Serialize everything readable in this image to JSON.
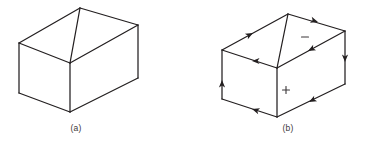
{
  "figure": {
    "title": "",
    "background_color": "#ffffff",
    "line_color": "#231f20",
    "panels": [
      {
        "id": "a",
        "label": "(a)",
        "label_x": 76,
        "label_y": 131,
        "description": "open rectangular box drawn in wireframe, no orientation arrows",
        "vertices": {
          "back_left": [
            19,
            43
          ],
          "back_top": [
            80,
            8
          ],
          "right_top": [
            138,
            25
          ],
          "front_top": [
            70,
            63
          ],
          "front_bottom": [
            70,
            112
          ],
          "left_bottom": [
            19,
            93
          ],
          "right_bottom": [
            138,
            78
          ]
        },
        "edges": [
          [
            [
              19,
              43
            ],
            [
              80,
              8
            ]
          ],
          [
            [
              80,
              8
            ],
            [
              138,
              25
            ]
          ],
          [
            [
              138,
              25
            ],
            [
              70,
              63
            ]
          ],
          [
            [
              70,
              63
            ],
            [
              19,
              43
            ]
          ],
          [
            [
              80,
              8
            ],
            [
              70,
              63
            ]
          ],
          [
            [
              19,
              43
            ],
            [
              19,
              93
            ]
          ],
          [
            [
              70,
              63
            ],
            [
              70,
              112
            ]
          ],
          [
            [
              138,
              25
            ],
            [
              138,
              78
            ]
          ],
          [
            [
              19,
              93
            ],
            [
              70,
              112
            ]
          ],
          [
            [
              70,
              112
            ],
            [
              138,
              78
            ]
          ]
        ],
        "arrows": []
      },
      {
        "id": "b",
        "label": "(b)",
        "label_x": 288,
        "label_y": 131,
        "description": "same box with directed edges showing induced orientation; plus sign on front face, minus sign on top-right face",
        "vertices": {
          "back_left": [
            222,
            50
          ],
          "back_top": [
            288,
            14
          ],
          "right_top": [
            345,
            31
          ],
          "front_top": [
            277,
            68
          ],
          "front_bottom": [
            277,
            117
          ],
          "left_bottom": [
            222,
            99
          ],
          "right_bottom": [
            345,
            84
          ]
        },
        "edges": [
          [
            [
              222,
              50
            ],
            [
              288,
              14
            ]
          ],
          [
            [
              288,
              14
            ],
            [
              345,
              31
            ]
          ],
          [
            [
              345,
              31
            ],
            [
              277,
              68
            ]
          ],
          [
            [
              277,
              68
            ],
            [
              222,
              50
            ]
          ],
          [
            [
              288,
              14
            ],
            [
              277,
              68
            ]
          ],
          [
            [
              222,
              50
            ],
            [
              222,
              99
            ]
          ],
          [
            [
              277,
              68
            ],
            [
              277,
              117
            ]
          ],
          [
            [
              345,
              31
            ],
            [
              345,
              84
            ]
          ],
          [
            [
              222,
              99
            ],
            [
              277,
              117
            ]
          ],
          [
            [
              277,
              117
            ],
            [
              345,
              84
            ]
          ]
        ],
        "arrows": [
          {
            "at": [
              253,
              33
            ],
            "angle": -28,
            "on_edge": "back-left-top"
          },
          {
            "at": [
              318,
              22
            ],
            "angle": 17,
            "on_edge": "back-top-right"
          },
          {
            "at": [
              308,
              51
            ],
            "angle": 152,
            "on_edge": "right-top-to-front-top"
          },
          {
            "at": [
              252,
              61
            ],
            "angle": 180,
            "on_edge": "front-top-to-back-left"
          },
          {
            "at": [
              222,
              80
            ],
            "angle": -90,
            "on_edge": "left-vertical"
          },
          {
            "at": [
              345,
              62
            ],
            "angle": 90,
            "on_edge": "right-vertical"
          },
          {
            "at": [
              252,
              109
            ],
            "angle": 198,
            "on_edge": "bottom-left"
          },
          {
            "at": [
              309,
              102
            ],
            "angle": 152,
            "on_edge": "bottom-right"
          }
        ],
        "signs": [
          {
            "symbol": "minus",
            "x": 305,
            "y": 37,
            "size": 7
          },
          {
            "symbol": "plus",
            "x": 286,
            "y": 90,
            "size": 7
          }
        ]
      }
    ]
  }
}
